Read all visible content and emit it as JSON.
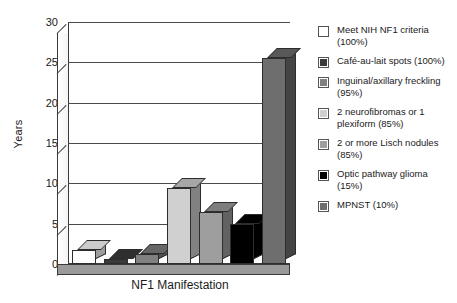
{
  "chart_data": {
    "type": "bar",
    "title": "",
    "xlabel": "NF1 Manifestation",
    "ylabel": "Years",
    "ylim": [
      0,
      30
    ],
    "ytick_values": [
      30,
      25,
      20,
      15,
      10,
      5,
      0
    ],
    "ytick_labels": [
      "30",
      "25",
      "20",
      "15",
      "10",
      "5",
      "0"
    ],
    "grid": true,
    "legend_position": "right",
    "style": "3d-column",
    "categories": [
      "Meet NIH NF1 criteria (100%)",
      "Café-au-lait spots (100%)",
      "Inguinal/axillary freckling (95%)",
      "2 neurofibromas or 1 plexiform (85%)",
      "2 or more Lisch nodules (85%)",
      "Optic pathway glioma (15%)",
      "MPNST (10%)"
    ],
    "values": [
      1.7,
      0.6,
      1.3,
      9.4,
      6.4,
      4.9,
      25.5
    ],
    "colors": [
      "#ffffff",
      "#3a3a3a",
      "#808080",
      "#d0d0d0",
      "#9e9e9e",
      "#000000",
      "#6e6e6e"
    ]
  },
  "axes": {
    "y_label": "Years",
    "x_label": "NF1 Manifestation",
    "ticks": [
      {
        "label": "30"
      },
      {
        "label": "25"
      },
      {
        "label": "20"
      },
      {
        "label": "15"
      },
      {
        "label": "10"
      },
      {
        "label": "5"
      },
      {
        "label": "0"
      }
    ]
  },
  "legend": {
    "items": [
      {
        "label": "Meet NIH NF1 criteria (100%)",
        "color": "#ffffff"
      },
      {
        "label": "Café-au-lait spots (100%)",
        "color": "#3a3a3a"
      },
      {
        "label": "Inguinal/axillary freckling (95%)",
        "color": "#808080"
      },
      {
        "label": "2 neurofibromas or 1 plexiform (85%)",
        "color": "#d0d0d0"
      },
      {
        "label": "2 or more Lisch nodules (85%)",
        "color": "#9e9e9e"
      },
      {
        "label": "Optic pathway glioma (15%)",
        "color": "#000000"
      },
      {
        "label": "MPNST (10%)",
        "color": "#6e6e6e"
      }
    ]
  }
}
